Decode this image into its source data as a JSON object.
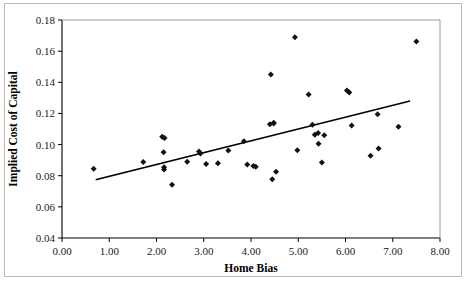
{
  "chart_data": {
    "type": "scatter",
    "title": "",
    "xlabel": "Home Bias",
    "ylabel": "Implied Cost of Capital",
    "xlim": [
      0.0,
      8.0
    ],
    "ylim": [
      0.04,
      0.18
    ],
    "xticks": [
      "0.00",
      "1.00",
      "2.00",
      "3.00",
      "4.00",
      "5.00",
      "6.00",
      "7.00",
      "8.00"
    ],
    "xtick_values": [
      0.0,
      1.0,
      2.0,
      3.0,
      4.0,
      5.0,
      6.0,
      7.0,
      8.0
    ],
    "yticks": [
      "0.04",
      "0.06",
      "0.08",
      "0.10",
      "0.12",
      "0.14",
      "0.16",
      "0.18"
    ],
    "ytick_values": [
      0.04,
      0.06,
      0.08,
      0.1,
      0.12,
      0.14,
      0.16,
      0.18
    ],
    "grid": false,
    "legend": null,
    "marker": "diamond",
    "marker_color": "#111111",
    "points": [
      {
        "x": 0.67,
        "y": 0.0845
      },
      {
        "x": 1.72,
        "y": 0.0888
      },
      {
        "x": 2.12,
        "y": 0.105
      },
      {
        "x": 2.17,
        "y": 0.1043
      },
      {
        "x": 2.15,
        "y": 0.095
      },
      {
        "x": 2.16,
        "y": 0.0855
      },
      {
        "x": 2.16,
        "y": 0.084
      },
      {
        "x": 2.33,
        "y": 0.0742
      },
      {
        "x": 2.65,
        "y": 0.089
      },
      {
        "x": 2.9,
        "y": 0.0955
      },
      {
        "x": 2.93,
        "y": 0.0942
      },
      {
        "x": 3.05,
        "y": 0.0875
      },
      {
        "x": 3.3,
        "y": 0.088
      },
      {
        "x": 3.52,
        "y": 0.0962
      },
      {
        "x": 3.85,
        "y": 0.1022
      },
      {
        "x": 3.92,
        "y": 0.0872
      },
      {
        "x": 4.05,
        "y": 0.0862
      },
      {
        "x": 4.1,
        "y": 0.0858
      },
      {
        "x": 4.42,
        "y": 0.145
      },
      {
        "x": 4.4,
        "y": 0.113
      },
      {
        "x": 4.48,
        "y": 0.114
      },
      {
        "x": 4.48,
        "y": 0.1135
      },
      {
        "x": 4.45,
        "y": 0.0778
      },
      {
        "x": 4.53,
        "y": 0.0825
      },
      {
        "x": 4.93,
        "y": 0.169
      },
      {
        "x": 4.98,
        "y": 0.0963
      },
      {
        "x": 5.22,
        "y": 0.1322
      },
      {
        "x": 5.3,
        "y": 0.1128
      },
      {
        "x": 5.35,
        "y": 0.1063
      },
      {
        "x": 5.42,
        "y": 0.1075
      },
      {
        "x": 5.43,
        "y": 0.1005
      },
      {
        "x": 5.55,
        "y": 0.106
      },
      {
        "x": 5.5,
        "y": 0.0885
      },
      {
        "x": 6.03,
        "y": 0.1348
      },
      {
        "x": 6.08,
        "y": 0.1335
      },
      {
        "x": 6.13,
        "y": 0.1123
      },
      {
        "x": 6.53,
        "y": 0.0928
      },
      {
        "x": 6.68,
        "y": 0.1195
      },
      {
        "x": 6.7,
        "y": 0.0975
      },
      {
        "x": 7.12,
        "y": 0.1115
      },
      {
        "x": 7.5,
        "y": 0.1662
      }
    ],
    "trend_line": {
      "x_start": 0.73,
      "y_start": 0.0775,
      "x_end": 7.35,
      "y_end": 0.1278
    }
  }
}
